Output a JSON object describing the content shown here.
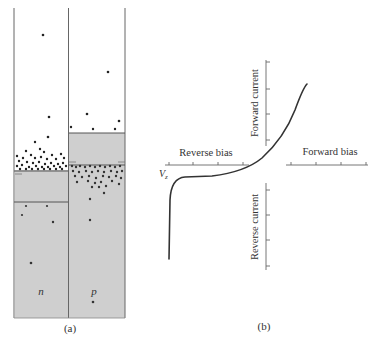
{
  "figure": {
    "panel_a": {
      "caption": "(a)",
      "n_label": "n",
      "p_label": "p",
      "colors": {
        "band_fill": "#cfcfcf",
        "line": "#555555",
        "carrier": "#222222"
      }
    },
    "panel_b": {
      "caption": "(b)",
      "forward_current_label": "Forward current",
      "reverse_current_label": "Reverse current",
      "reverse_bias_label": "Reverse bias",
      "forward_bias_label": "Forward bias",
      "breakdown_label": "V",
      "breakdown_subscript": "z",
      "colors": {
        "curve": "#333333",
        "axis": "#555555"
      }
    }
  }
}
